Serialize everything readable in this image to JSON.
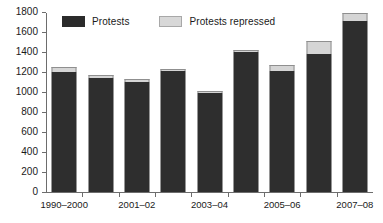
{
  "chart_data": {
    "type": "bar",
    "subtype": "stacked-bar",
    "title": "",
    "xlabel": "",
    "ylabel": "",
    "ylim": [
      0,
      1800
    ],
    "yticks": [
      0,
      200,
      400,
      600,
      800,
      1000,
      1200,
      1400,
      1600,
      1800
    ],
    "ytick_labels": [
      "0",
      "200",
      "400",
      "600",
      "800",
      "1000",
      "1200",
      "1400",
      "1600",
      "1800"
    ],
    "grid": false,
    "legend_position": "top",
    "categories": [
      "1999–2000",
      "2000–01",
      "2001–02",
      "2002–03",
      "2003–04",
      "2004–05",
      "2005–06",
      "2006–07",
      "2007–08"
    ],
    "xtick_labels": [
      "1990–2000",
      "2001–02",
      "2003–04",
      "2005–06",
      "2007–08"
    ],
    "series": [
      {
        "name": "Protests",
        "color": "#2e2e2e",
        "values": [
          1200,
          1140,
          1100,
          1210,
          990,
          1400,
          1215,
          1380,
          1710
        ]
      },
      {
        "name": "Protests repressed",
        "color": "#d5d5d5",
        "values": [
          50,
          30,
          30,
          25,
          25,
          20,
          60,
          130,
          80
        ]
      }
    ],
    "totals": [
      1250,
      1170,
      1130,
      1235,
      1015,
      1420,
      1275,
      1510,
      1790
    ]
  },
  "legend": {
    "items": [
      {
        "label": "Protests",
        "swatch": "dark-square-swatch"
      },
      {
        "label": "Protests repressed",
        "swatch": "light-square-swatch"
      }
    ]
  }
}
